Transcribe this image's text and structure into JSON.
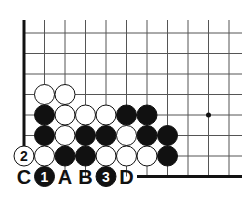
{
  "diagram": {
    "type": "go-board-fragment",
    "corner": "lower-left",
    "star_point": {
      "col": 9,
      "row": 4
    },
    "stones": [
      {
        "color": "white",
        "col": 1,
        "row": 3
      },
      {
        "color": "white",
        "col": 2,
        "row": 3
      },
      {
        "color": "black",
        "col": 1,
        "row": 4
      },
      {
        "color": "white",
        "col": 2,
        "row": 4
      },
      {
        "color": "white",
        "col": 3,
        "row": 4
      },
      {
        "color": "white",
        "col": 4,
        "row": 4
      },
      {
        "color": "black",
        "col": 5,
        "row": 4
      },
      {
        "color": "black",
        "col": 6,
        "row": 4
      },
      {
        "color": "black",
        "col": 1,
        "row": 5
      },
      {
        "color": "white",
        "col": 2,
        "row": 5
      },
      {
        "color": "black",
        "col": 3,
        "row": 5
      },
      {
        "color": "black",
        "col": 4,
        "row": 5
      },
      {
        "color": "white",
        "col": 5,
        "row": 5
      },
      {
        "color": "black",
        "col": 6,
        "row": 5
      },
      {
        "color": "black",
        "col": 7,
        "row": 5
      },
      {
        "color": "white",
        "col": 0,
        "row": 6,
        "label": "2"
      },
      {
        "color": "white",
        "col": 1,
        "row": 6
      },
      {
        "color": "black",
        "col": 2,
        "row": 6
      },
      {
        "color": "black",
        "col": 3,
        "row": 6
      },
      {
        "color": "white",
        "col": 4,
        "row": 6
      },
      {
        "color": "white",
        "col": 5,
        "row": 6
      },
      {
        "color": "white",
        "col": 6,
        "row": 6
      },
      {
        "color": "black",
        "col": 7,
        "row": 6
      },
      {
        "color": "black",
        "col": 1,
        "row": 7,
        "label": "1"
      },
      {
        "color": "black",
        "col": 4,
        "row": 7,
        "label": "3"
      }
    ],
    "letters": [
      {
        "text": "C",
        "col": 0,
        "row": 7
      },
      {
        "text": "A",
        "col": 2,
        "row": 7
      },
      {
        "text": "B",
        "col": 3,
        "row": 7
      },
      {
        "text": "D",
        "col": 5,
        "row": 7
      }
    ]
  }
}
